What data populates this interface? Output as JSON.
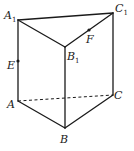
{
  "diagram": {
    "type": "triangular prism",
    "vertices": {
      "A1": {
        "label": "A",
        "sub": "1",
        "x": 18,
        "y": 20
      },
      "B1": {
        "label": "B",
        "sub": "1",
        "x": 65,
        "y": 47
      },
      "C1": {
        "label": "C",
        "sub": "1",
        "x": 113,
        "y": 13
      },
      "A": {
        "label": "A",
        "sub": "",
        "x": 18,
        "y": 101
      },
      "B": {
        "label": "B",
        "sub": "",
        "x": 65,
        "y": 128
      },
      "C": {
        "label": "C",
        "sub": "",
        "x": 113,
        "y": 95
      }
    },
    "points": {
      "E": {
        "label": "E",
        "on": "AA1",
        "x": 18,
        "y": 61
      },
      "F": {
        "label": "F",
        "on": "B1C1",
        "x": 89,
        "y": 30
      }
    },
    "edges_solid": [
      "A1B1",
      "A1C1",
      "B1C1",
      "AA1",
      "BB1",
      "CC1",
      "AB",
      "BC"
    ],
    "edges_dashed": [
      "AC"
    ],
    "colors": {
      "stroke": "#1a1a1a",
      "background": "#ffffff"
    }
  }
}
